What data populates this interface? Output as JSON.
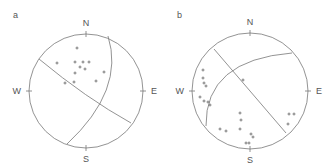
{
  "panels": [
    {
      "label": "a",
      "directions": {
        "north": "N",
        "south": "S",
        "east": "E",
        "west": "W"
      },
      "center": [
        86,
        91
      ],
      "radius": 57,
      "great_circles": [
        "M 39 59 Q 86 98 131 123",
        "M 108 36 Q 125 90 67 144"
      ],
      "points": [
        [
          77,
          48
        ],
        [
          57,
          63
        ],
        [
          75,
          62
        ],
        [
          83,
          62
        ],
        [
          89,
          62
        ],
        [
          80,
          67
        ],
        [
          85,
          69
        ],
        [
          75,
          73
        ],
        [
          104,
          72
        ],
        [
          74,
          82
        ],
        [
          65,
          83
        ],
        [
          96,
          81
        ]
      ]
    },
    {
      "label": "b",
      "directions": {
        "north": "N",
        "south": "S",
        "east": "E",
        "west": "W"
      },
      "center": [
        250,
        91
      ],
      "radius": 58,
      "great_circles": [
        "M 214 49 L 286 133",
        "M 206 126 Q 205 60 292 53"
      ],
      "points": [
        [
          203,
          70
        ],
        [
          203,
          78
        ],
        [
          204,
          83
        ],
        [
          206,
          86
        ],
        [
          200,
          97
        ],
        [
          204,
          101
        ],
        [
          208,
          102
        ],
        [
          210,
          105
        ],
        [
          243,
          80
        ],
        [
          240,
          113
        ],
        [
          241,
          120
        ],
        [
          220,
          129
        ],
        [
          226,
          131
        ],
        [
          240,
          129
        ],
        [
          251,
          134
        ],
        [
          253,
          137
        ],
        [
          246,
          143
        ],
        [
          249,
          143
        ],
        [
          289,
          114
        ],
        [
          294,
          114
        ],
        [
          288,
          124
        ]
      ]
    }
  ]
}
